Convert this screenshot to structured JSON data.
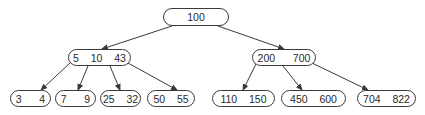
{
  "diagram": {
    "type": "B-tree",
    "colors": {
      "stroke": "#3a3a3a",
      "text": "#2a2a2a",
      "background": "#ffffff"
    },
    "nodes": [
      {
        "id": "root",
        "label": "100",
        "keys": [
          100
        ],
        "x": 163,
        "y": 8,
        "w": 66,
        "h": 18
      },
      {
        "id": "internal-left",
        "label": "5  10  43",
        "keys": [
          5,
          10,
          43
        ],
        "x": 68,
        "y": 49,
        "w": 63,
        "h": 17
      },
      {
        "id": "internal-right",
        "label": "200   700",
        "keys": [
          200,
          700
        ],
        "x": 252,
        "y": 49,
        "w": 64,
        "h": 17
      },
      {
        "id": "leaf-1",
        "label": "3   4",
        "keys": [
          3,
          4
        ],
        "x": 10,
        "y": 90,
        "w": 41,
        "h": 17
      },
      {
        "id": "leaf-2",
        "label": "7   9",
        "keys": [
          7,
          9
        ],
        "x": 55,
        "y": 90,
        "w": 41,
        "h": 17
      },
      {
        "id": "leaf-3",
        "label": "25  32",
        "keys": [
          25,
          32
        ],
        "x": 100,
        "y": 90,
        "w": 41,
        "h": 17
      },
      {
        "id": "leaf-4",
        "label": "50  55",
        "keys": [
          50,
          55
        ],
        "x": 147,
        "y": 90,
        "w": 48,
        "h": 17
      },
      {
        "id": "leaf-5",
        "label": "110  150",
        "keys": [
          110,
          150
        ],
        "x": 212,
        "y": 90,
        "w": 63,
        "h": 17
      },
      {
        "id": "leaf-6",
        "label": "450  600",
        "keys": [
          450,
          600
        ],
        "x": 281,
        "y": 90,
        "w": 65,
        "h": 17
      },
      {
        "id": "leaf-7",
        "label": "704  822",
        "keys": [
          704,
          822
        ],
        "x": 357,
        "y": 90,
        "w": 59,
        "h": 17
      }
    ],
    "edges": [
      {
        "from": "root",
        "to": "internal-left",
        "x1": 172,
        "y1": 26,
        "x2": 102,
        "y2": 49
      },
      {
        "from": "root",
        "to": "internal-right",
        "x1": 218,
        "y1": 26,
        "x2": 284,
        "y2": 49
      },
      {
        "from": "internal-left",
        "to": "leaf-1",
        "x1": 70,
        "y1": 63,
        "x2": 41,
        "y2": 90
      },
      {
        "from": "internal-left",
        "to": "leaf-2",
        "x1": 88,
        "y1": 66,
        "x2": 78,
        "y2": 90
      },
      {
        "from": "internal-left",
        "to": "leaf-3",
        "x1": 110,
        "y1": 66,
        "x2": 120,
        "y2": 90
      },
      {
        "from": "internal-left",
        "to": "leaf-4",
        "x1": 128,
        "y1": 63,
        "x2": 177,
        "y2": 90
      },
      {
        "from": "internal-right",
        "to": "leaf-5",
        "x1": 256,
        "y1": 64,
        "x2": 243,
        "y2": 90
      },
      {
        "from": "internal-right",
        "to": "leaf-6",
        "x1": 283,
        "y1": 66,
        "x2": 302,
        "y2": 90
      },
      {
        "from": "internal-right",
        "to": "leaf-7",
        "x1": 312,
        "y1": 63,
        "x2": 368,
        "y2": 90
      }
    ]
  }
}
